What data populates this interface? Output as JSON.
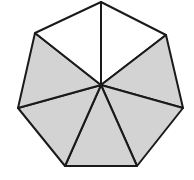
{
  "diagram": {
    "shape": "heptagon",
    "total_parts": 7,
    "shaded_parts": 5,
    "unshaded_parts": 2,
    "center": [
      101,
      85
    ],
    "vertices": [
      [
        101,
        2
      ],
      [
        166,
        35
      ],
      [
        183,
        108
      ],
      [
        137,
        166
      ],
      [
        65,
        166
      ],
      [
        18,
        108
      ],
      [
        35,
        33
      ]
    ],
    "shaded_sectors": [
      1,
      2,
      3,
      4,
      5
    ],
    "colors": {
      "shade": "#d3d3d3",
      "stroke": "#1a1a1a",
      "background": "#ffffff"
    }
  }
}
